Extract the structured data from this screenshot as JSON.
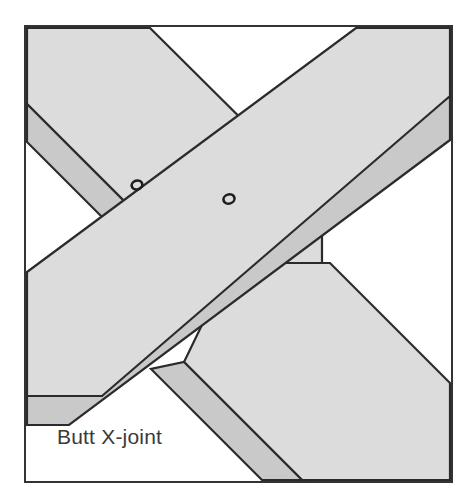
{
  "figure": {
    "title": "Butt X-joint",
    "caption": "Butt X-joint",
    "kind": "timber-joint-diagram",
    "frame": {
      "x": 25,
      "y": 26,
      "width": 427,
      "height": 456,
      "border_color": "#333333",
      "border_width": 2,
      "background": "#ffffff"
    },
    "colors": {
      "member_face": "#dcdcdc",
      "member_edge_band": "#c9c9c9",
      "outline": "#2b2b2b",
      "caption": "#3a3a3a",
      "background": "#ffffff"
    },
    "members": [
      {
        "name": "back-diagonal-upper-left",
        "label": "upper-left diagonal member (behind)",
        "face_points": "27,28 150,28 322,199 322,283 206,283 27,104",
        "band_points": "27,104 206,283 168,283 27,142"
      },
      {
        "name": "back-diagonal-lower-right",
        "label": "lower-right diagonal member (behind)",
        "face_points": "232,263 330,263 450,383 450,480 302,480 184,362",
        "band_points": "184,362 302,480 262,480 151,369"
      },
      {
        "name": "front-beam",
        "label": "front horizontal-diagonal beam (in front)",
        "face_points": "27,272 356,28 450,28 450,96 102,396 27,396",
        "band_points": "27,396 450,96 450,140 69,425 27,425"
      }
    ],
    "fasteners": [
      {
        "name": "bolt-hole-left",
        "cx": 137,
        "cy": 185,
        "rx": 5.4,
        "ry": 4.4,
        "rotation": -18
      },
      {
        "name": "bolt-hole-right",
        "cx": 229,
        "cy": 199,
        "rx": 5.6,
        "ry": 4.6,
        "rotation": -18
      }
    ],
    "caption_position": {
      "x": 57,
      "y": 444
    }
  }
}
